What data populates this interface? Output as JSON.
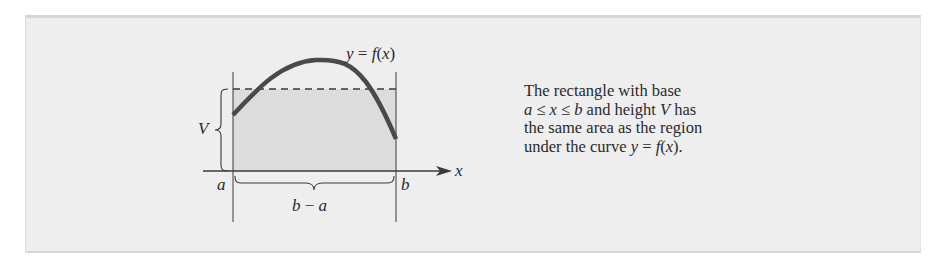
{
  "figure": {
    "curve_label": {
      "var": "y",
      "eq": " = ",
      "func": "f",
      "arg_open": "(",
      "arg": "x",
      "arg_close": ")"
    },
    "height_label": "V",
    "axis_label": "x",
    "left_bound_label": "a",
    "right_bound_label": "b",
    "width_label": {
      "b": "b",
      "minus": " − ",
      "a": "a"
    },
    "colors": {
      "background": "#eeeeee",
      "fill": "#dcdcdc",
      "curve": "#4a4a4a",
      "lines": "#3a3a3a"
    }
  },
  "caption": {
    "line1": "The rectangle with base",
    "line2": {
      "a": "a",
      "le1": " ≤ ",
      "x": "x",
      "le2": " ≤ ",
      "b": "b",
      "rest": " and height ",
      "V": "V",
      "end": " has"
    },
    "line3": "the same area as the region",
    "line4": {
      "text": "under the curve ",
      "y": "y",
      "eq": " = ",
      "f": "f",
      "open": "(",
      "x": "x",
      "close": ")."
    }
  }
}
